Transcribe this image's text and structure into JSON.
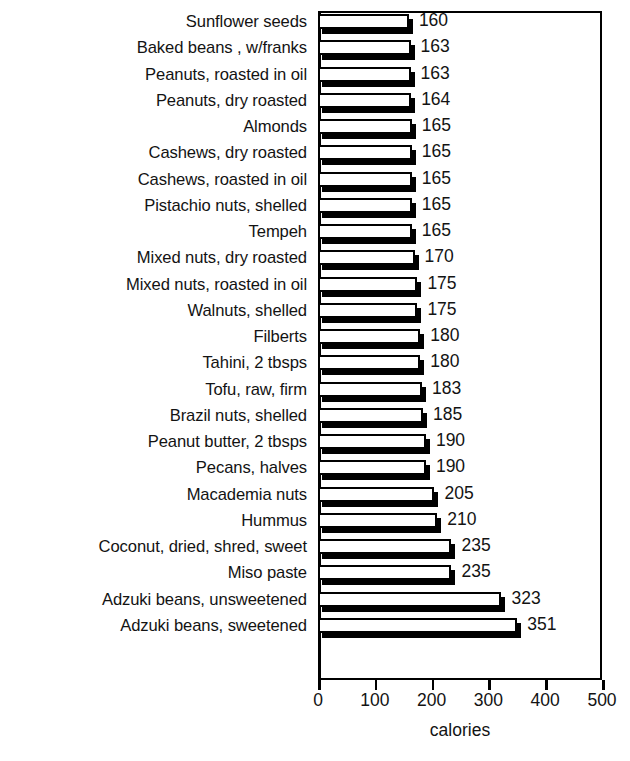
{
  "chart_data": {
    "type": "bar",
    "orientation": "horizontal",
    "title": "",
    "xlabel": "calories",
    "ylabel": "",
    "xlim": [
      0,
      500
    ],
    "xticks": [
      0,
      100,
      200,
      300,
      400,
      500
    ],
    "xtick_labels": [
      "0",
      "100",
      "200",
      "300",
      "400",
      "500"
    ],
    "grid": false,
    "legend": null,
    "bar_style": "3d-extruded-white-face-black-shadow",
    "value_labels_shown": true,
    "categories": [
      "Sunflower seeds",
      "Baked beans , w/franks",
      "Peanuts, roasted in oil",
      "Peanuts, dry roasted",
      "Almonds",
      "Cashews, dry roasted",
      "Cashews, roasted in oil",
      "Pistachio nuts, shelled",
      "Tempeh",
      "Mixed nuts, dry roasted",
      "Mixed nuts, roasted in oil",
      "Walnuts, shelled",
      "Filberts",
      "Tahini, 2 tbsps",
      "Tofu, raw, firm",
      "Brazil nuts, shelled",
      "Peanut butter, 2 tbsps",
      "Pecans, halves",
      "Macademia nuts",
      "Hummus",
      "Coconut, dried, shred, sweet",
      "Miso paste",
      "Adzuki beans, unsweetened",
      "Adzuki beans, sweetened"
    ],
    "values": [
      160,
      163,
      163,
      164,
      165,
      165,
      165,
      165,
      165,
      170,
      175,
      175,
      180,
      180,
      183,
      185,
      190,
      190,
      205,
      210,
      235,
      235,
      323,
      351
    ],
    "value_label_texts": [
      "160",
      "163",
      "163",
      "164",
      "165",
      "165",
      "165",
      "165",
      "165",
      "170",
      "175",
      "175",
      "180",
      "180",
      "183",
      "185",
      "190",
      "190",
      "205",
      "210",
      "235",
      "235",
      "323",
      "351"
    ]
  },
  "colors": {
    "bar_face": "#ffffff",
    "bar_outline": "#000000",
    "bar_shadow": "#000000",
    "axis": "#000000",
    "text": "#131313",
    "background": "#ffffff"
  }
}
